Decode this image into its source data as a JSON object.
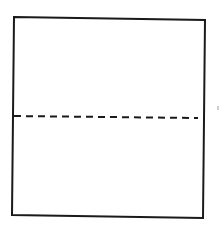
{
  "diagram": {
    "type": "folded-square",
    "colors": {
      "background": "#ffffff",
      "stroke": "#1a1a1a",
      "artifact": "#9a9a9a"
    },
    "square": {
      "corners": {
        "top_left": [
          14,
          17
        ],
        "top_right": [
          205,
          20
        ],
        "bottom_right": [
          203,
          218
        ],
        "bottom_left": [
          12,
          215
        ]
      },
      "stroke_width": 2
    },
    "fold_line": {
      "style": "dashed",
      "start": [
        14,
        116
      ],
      "end": [
        198,
        118
      ],
      "dash": [
        7,
        5
      ],
      "stroke_width": 2
    },
    "artifact_mark": {
      "position": [
        218,
        108
      ]
    }
  }
}
